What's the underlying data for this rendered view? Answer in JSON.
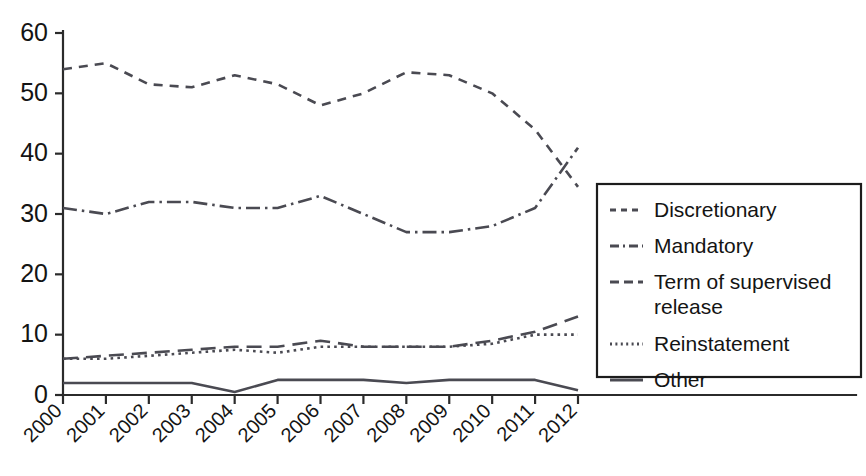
{
  "chart_data": {
    "type": "line",
    "title": "",
    "xlabel": "",
    "ylabel": "",
    "x": [
      2000,
      2001,
      2002,
      2003,
      2004,
      2005,
      2006,
      2007,
      2008,
      2009,
      2010,
      2011,
      2012
    ],
    "categories": [
      "2000",
      "2001",
      "2002",
      "2003",
      "2004",
      "2005",
      "2006",
      "2007",
      "2008",
      "2009",
      "2010",
      "2011",
      "2012"
    ],
    "xlim": [
      2000,
      2012
    ],
    "ylim": [
      0,
      60
    ],
    "ytick_labels": [
      "0",
      "10",
      "20",
      "30",
      "40",
      "50",
      "60"
    ],
    "ytick_values": [
      0,
      10,
      20,
      30,
      40,
      50,
      60
    ],
    "grid": false,
    "legend_position": "right",
    "series": [
      {
        "name": "Discretionary",
        "style": "dashed",
        "values": [
          54,
          55,
          51.5,
          51,
          53,
          51.5,
          48,
          50,
          53.5,
          53,
          50,
          44,
          34.5
        ]
      },
      {
        "name": "Mandatory",
        "style": "dash-dot",
        "values": [
          31,
          30,
          32,
          32,
          31,
          31,
          33,
          30,
          27,
          27,
          28,
          31,
          41
        ]
      },
      {
        "name": "Term of supervised release",
        "style": "long-dash",
        "values": [
          6,
          6.5,
          7,
          7.5,
          8,
          8,
          9,
          8,
          8,
          8,
          9,
          10.5,
          13
        ]
      },
      {
        "name": "Reinstatement",
        "style": "dotted",
        "values": [
          6,
          6,
          6.5,
          7,
          7.5,
          7,
          8,
          8,
          8,
          8,
          8.5,
          10,
          10
        ]
      },
      {
        "name": "Other",
        "style": "solid",
        "values": [
          2,
          2,
          2,
          2,
          0.5,
          2.5,
          2.5,
          2.5,
          2,
          2.5,
          2.5,
          2.5,
          0.8
        ]
      }
    ]
  },
  "legend": {
    "items": [
      {
        "label": "Discretionary",
        "style": "dashed"
      },
      {
        "label": "Mandatory",
        "style": "dash-dot"
      },
      {
        "label": "Term of supervised",
        "label2": "release",
        "style": "long-dash"
      },
      {
        "label": "Reinstatement",
        "style": "dotted"
      },
      {
        "label": "Other",
        "style": "solid"
      }
    ]
  },
  "colors": {
    "line": "#4a4a52",
    "axis": "#2b2b2b",
    "text": "#141414",
    "background": "#ffffff"
  }
}
